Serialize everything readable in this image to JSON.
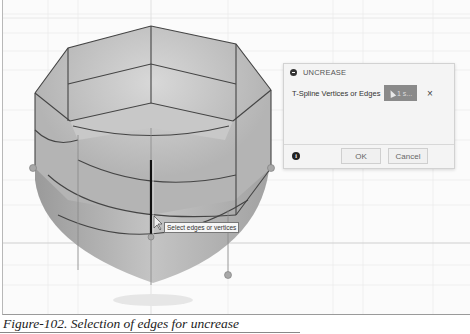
{
  "dialog": {
    "title": "UNCREASE",
    "field_label": "T-Spline Vertices or Edges",
    "selection_count": "1 s...",
    "clear_icon": "×",
    "ok_label": "OK",
    "cancel_label": "Cancel",
    "info_icon": "i"
  },
  "viewport": {
    "tooltip": "Select edges or vertices"
  },
  "caption": {
    "text": "Figure-102. Selection of edges for uncrease"
  }
}
